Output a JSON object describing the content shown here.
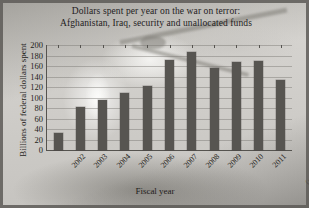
{
  "chart_data": {
    "type": "bar",
    "title": "Dollars spent per year on the war on terror: Afghanistan, Iraq, security and unallocated funds",
    "title_line1": "Dollars spent per year on the war on terror:",
    "title_line2": "Afghanistan, Iraq, security and unallocated funds",
    "xlabel": "Fiscal year",
    "ylabel": "Billions of federal dollars spent",
    "categories": [
      "2002",
      "2003",
      "2004",
      "2005",
      "2006",
      "2007",
      "2008",
      "2009",
      "2010",
      "2011",
      "2012"
    ],
    "category_notes": [
      "",
      "",
      "",
      "",
      "",
      "",
      "",
      "",
      "",
      "",
      "(pending)"
    ],
    "values": [
      32,
      82,
      95,
      108,
      122,
      172,
      187,
      156,
      167,
      170,
      133
    ],
    "ylim": [
      0,
      200
    ],
    "yticks": [
      200,
      180,
      160,
      140,
      120,
      100,
      80,
      60,
      40,
      20,
      0
    ],
    "grid": true,
    "legend": "none",
    "bar_color": "#575551",
    "axis_color": "#55534f",
    "text_color": "#1f1d1a",
    "background_image": "soldiers-and-helicopter-photo-faded"
  }
}
